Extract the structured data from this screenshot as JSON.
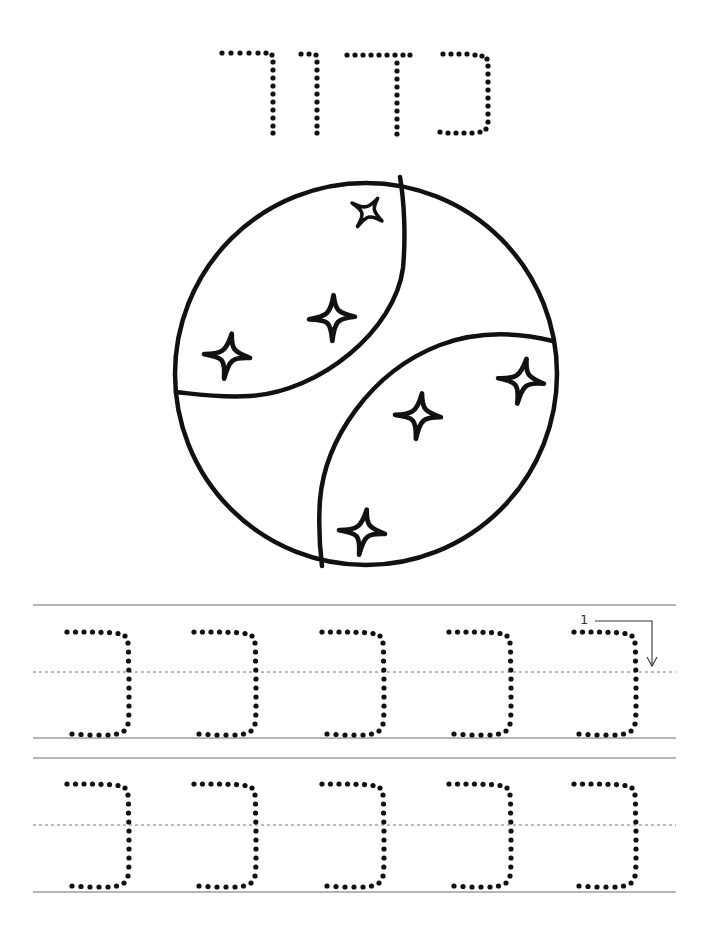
{
  "worksheet": {
    "title_word": "כדור",
    "title_letters": [
      "כ",
      "ד",
      "ו",
      "ר"
    ],
    "picture": "ball-with-stars",
    "stars_count": 6,
    "practice_letter": "כ",
    "rows": [
      {
        "letters": [
          "כ",
          "כ",
          "כ",
          "כ",
          "כ"
        ],
        "has_stroke_guide": true
      },
      {
        "letters": [
          "כ",
          "כ",
          "כ",
          "כ",
          "כ"
        ],
        "has_stroke_guide": false
      }
    ],
    "stroke_guide": {
      "step_number": "1",
      "icon": "arrow-down-icon"
    }
  },
  "colors": {
    "ink": "#111111",
    "rule_line": "#6f6f6f",
    "dashed_line": "#777777",
    "background": "#ffffff"
  }
}
